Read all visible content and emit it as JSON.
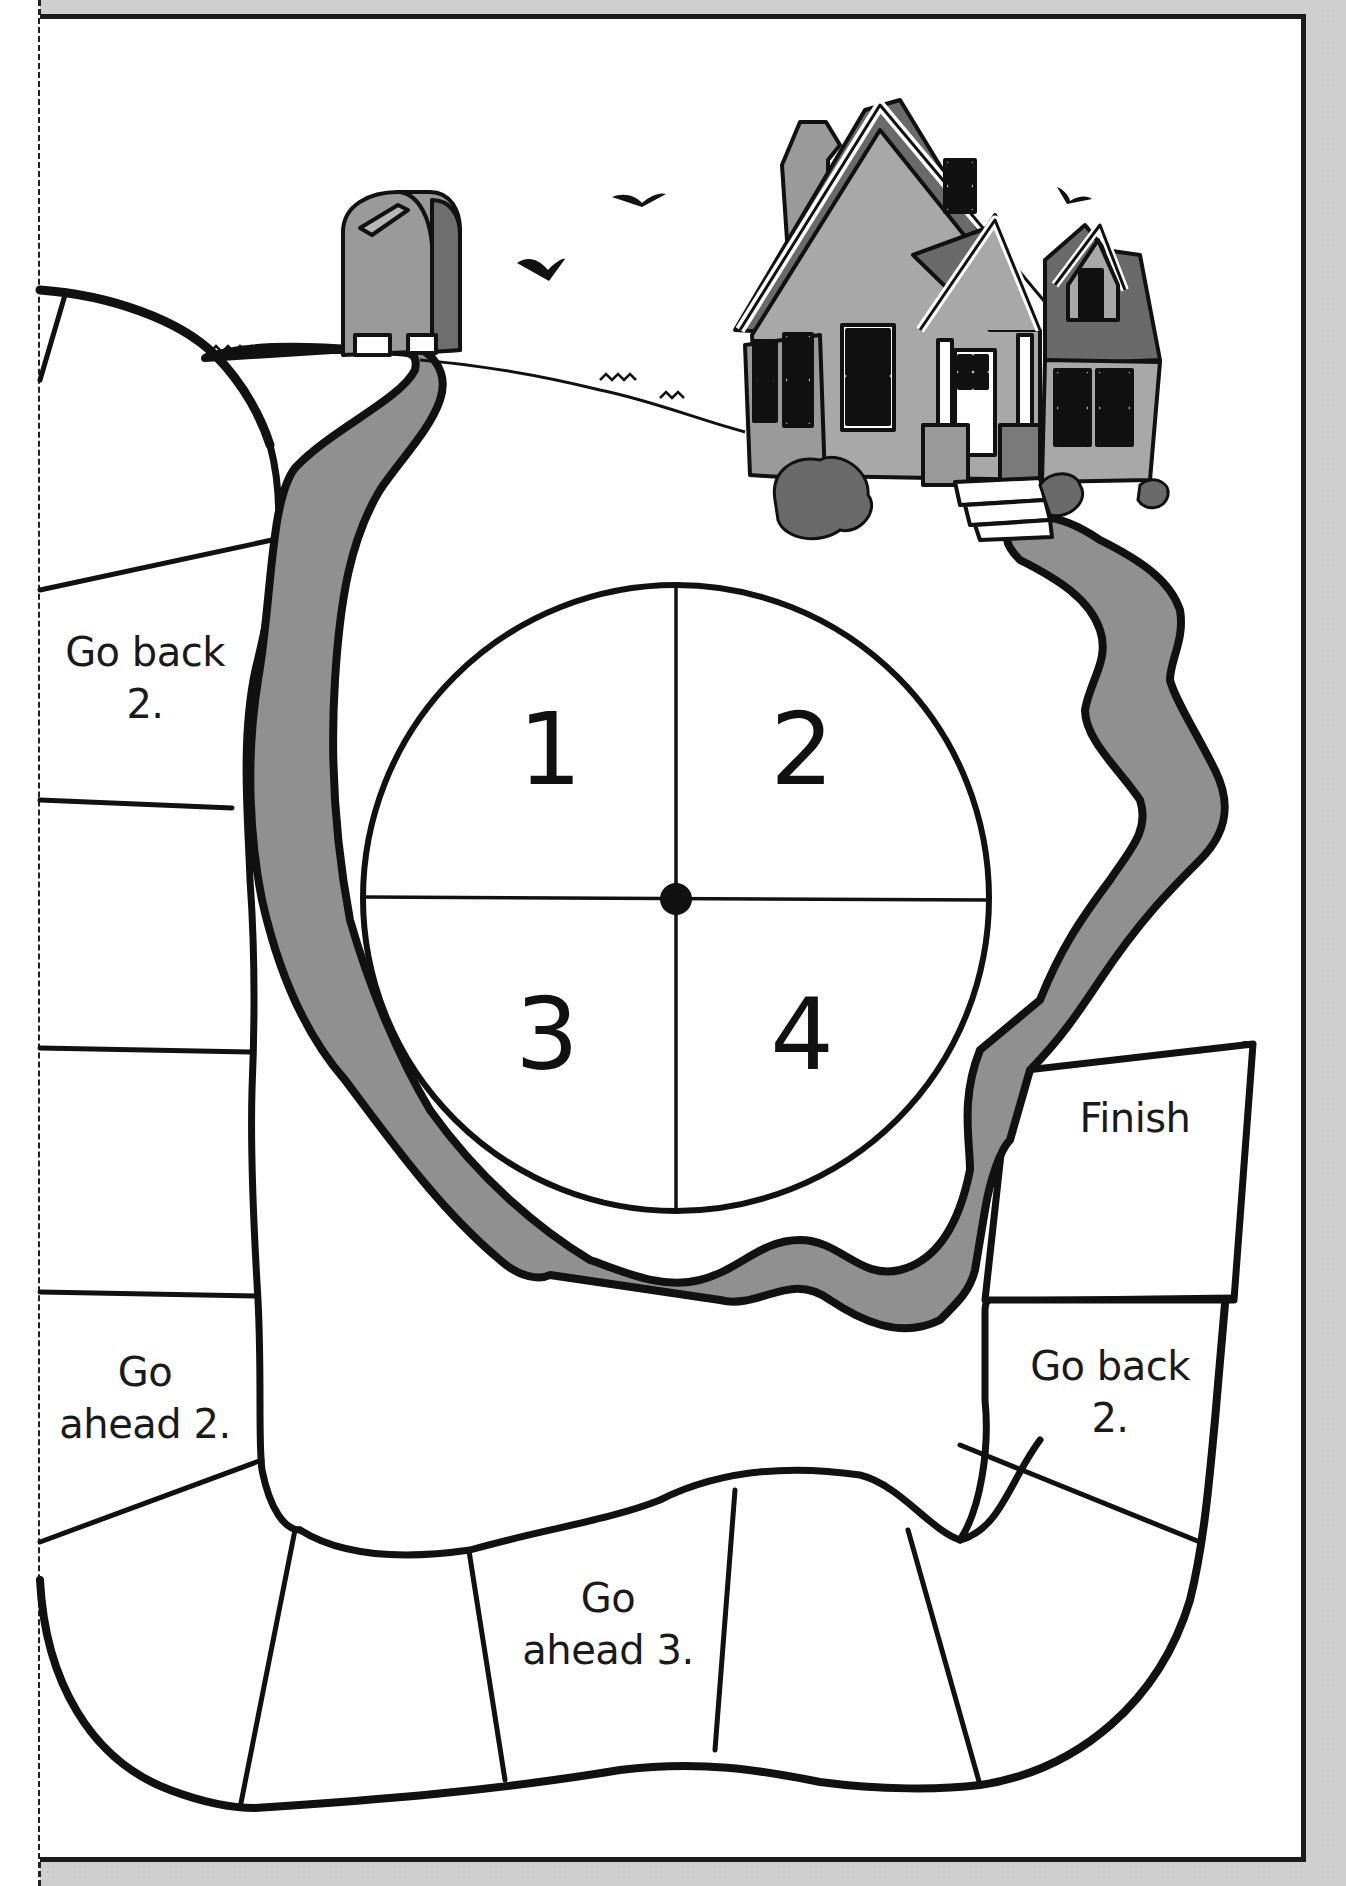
{
  "game": {
    "type": "board-game-printable",
    "scene": {
      "landmarks": [
        "mailbox",
        "house",
        "birds",
        "winding-road"
      ]
    },
    "spinner": {
      "sections": [
        {
          "value": "1",
          "position": "top-left"
        },
        {
          "value": "2",
          "position": "top-right"
        },
        {
          "value": "3",
          "position": "bottom-left"
        },
        {
          "value": "4",
          "position": "bottom-right"
        }
      ]
    },
    "spaces": {
      "left_go_back": "Go back\n2.",
      "left_go_back_line1": "Go back",
      "left_go_back_line2": "2.",
      "left_go_ahead_line1": "Go",
      "left_go_ahead_line2": "ahead 2.",
      "bottom_go_ahead_line1": "Go",
      "bottom_go_ahead_line2": "ahead 3.",
      "right_go_back_line1": "Go back",
      "right_go_back_line2": "2.",
      "finish": "Finish"
    },
    "colors": {
      "road": "#8f8f8f",
      "roof": "#6e6e6e",
      "house_wall": "#a9a9a9",
      "outline": "#111111",
      "page_background": "#cfcfcf",
      "board_background": "#ffffff"
    }
  }
}
